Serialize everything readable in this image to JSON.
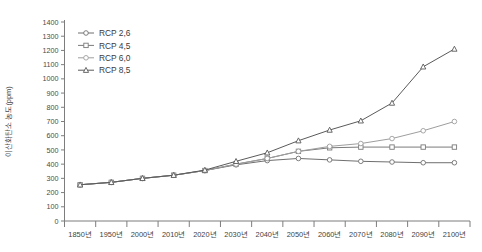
{
  "chart_data": {
    "type": "line",
    "title": "",
    "xlabel": "",
    "ylabel": "이산화탄소 농도(ppm)",
    "categories": [
      "1850년",
      "1950년",
      "2000년",
      "2010년",
      "2020년",
      "2030년",
      "2040년",
      "2050년",
      "2060년",
      "2070년",
      "2080년",
      "2090년",
      "2100년"
    ],
    "ylim": [
      0,
      1400
    ],
    "ytick_step": 100,
    "yticks": [
      0,
      100,
      200,
      300,
      400,
      500,
      600,
      700,
      800,
      900,
      1000,
      1100,
      1200,
      1300,
      1400
    ],
    "grid": false,
    "legend_position": "top-left",
    "series": [
      {
        "name": "RCP 2.6",
        "marker": "circle",
        "color": "#6f6f6f",
        "values": [
          255,
          272,
          300,
          322,
          355,
          395,
          425,
          440,
          430,
          420,
          415,
          410,
          410
        ]
      },
      {
        "name": "RCP 4.5",
        "marker": "square",
        "color": "#7a7a7a",
        "values": [
          255,
          272,
          300,
          322,
          355,
          400,
          440,
          490,
          515,
          520,
          520,
          520,
          520
        ]
      },
      {
        "name": "RCP 6.0",
        "marker": "circle-open",
        "color": "#9e9e9e",
        "values": [
          255,
          272,
          300,
          322,
          355,
          400,
          440,
          490,
          525,
          545,
          580,
          635,
          700
        ]
      },
      {
        "name": "RCP 8.5",
        "marker": "triangle",
        "color": "#5a5a5a",
        "values": [
          255,
          272,
          300,
          322,
          358,
          420,
          480,
          565,
          640,
          705,
          830,
          1085,
          1210
        ]
      }
    ]
  },
  "legend": {
    "items": [
      {
        "label": "RCP 2,6"
      },
      {
        "label": "RCP 4,5"
      },
      {
        "label": "RCP 6,0"
      },
      {
        "label": "RCP 8,5"
      }
    ]
  },
  "axis": {
    "y_title": "이산화탄소 농도(ppm)"
  }
}
